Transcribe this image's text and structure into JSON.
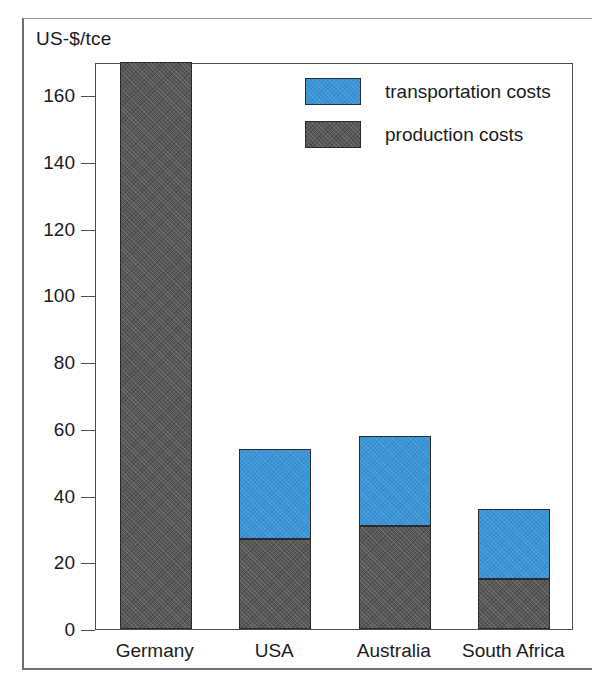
{
  "chart_data": {
    "type": "bar",
    "subtype": "stacked",
    "title": "",
    "xlabel": "",
    "ylabel": "US-$/tce",
    "ylim": [
      0,
      170
    ],
    "yticks": [
      0,
      20,
      40,
      60,
      80,
      100,
      120,
      140,
      160
    ],
    "ytick_labels": [
      "0",
      "20",
      "40",
      "60",
      "80",
      "100",
      "120",
      "140",
      "160"
    ],
    "grid": false,
    "legend_position": "upper-right-inside",
    "categories": [
      "Germany",
      "USA",
      "Australia",
      "South Africa"
    ],
    "series": [
      {
        "name": "production costs",
        "color": "#58585a",
        "values": [
          170,
          27,
          31,
          15
        ]
      },
      {
        "name": "transportation costs",
        "color": "#3a95d8",
        "values": [
          0,
          27,
          27,
          21
        ]
      }
    ],
    "totals": [
      170,
      54,
      58,
      36
    ],
    "legend": [
      {
        "label": "transportation costs",
        "color": "#3a95d8"
      },
      {
        "label": "production costs",
        "color": "#58585a"
      }
    ]
  },
  "axis": {
    "unit_caption": "US-$/tce"
  }
}
